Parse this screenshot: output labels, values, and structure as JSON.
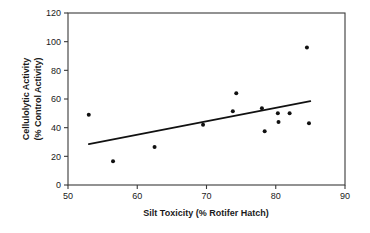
{
  "chart_data": {
    "type": "scatter",
    "title": "",
    "subtitle": "",
    "xlabel": "Silt Toxicity (% Rotifer Hatch)",
    "ylabel_line1": "Cellulolytic Activity",
    "ylabel_line2": "(% Control Activity)",
    "ylabel": "Cellulolytic Activity (% Control Activity)",
    "xlim": [
      50,
      90
    ],
    "ylim": [
      0,
      120
    ],
    "xticks": [
      50,
      60,
      70,
      80,
      90
    ],
    "yticks": [
      0,
      20,
      40,
      60,
      80,
      100,
      120
    ],
    "xtick_labels": [
      "50",
      "60",
      "70",
      "80",
      "90"
    ],
    "ytick_labels": [
      "0",
      "20",
      "40",
      "60",
      "80",
      "100",
      "120"
    ],
    "grid": false,
    "legend": null,
    "legend_position": "none",
    "marker": "filled-circle",
    "marker_color": "#111111",
    "series": [
      {
        "name": "Cellulolytic activity vs silt toxicity",
        "points": [
          {
            "x": 53.0,
            "y": 49.0
          },
          {
            "x": 56.5,
            "y": 16.5
          },
          {
            "x": 62.5,
            "y": 26.5
          },
          {
            "x": 69.5,
            "y": 42.0
          },
          {
            "x": 73.8,
            "y": 51.5
          },
          {
            "x": 74.3,
            "y": 64.0
          },
          {
            "x": 78.0,
            "y": 53.5
          },
          {
            "x": 78.4,
            "y": 37.5
          },
          {
            "x": 80.3,
            "y": 50.0
          },
          {
            "x": 80.4,
            "y": 44.0
          },
          {
            "x": 82.0,
            "y": 50.0
          },
          {
            "x": 84.5,
            "y": 96.0
          },
          {
            "x": 84.8,
            "y": 43.0
          }
        ]
      }
    ],
    "trendline": {
      "name": "linear regression fit",
      "x_start": 53.0,
      "y_start": 28.5,
      "x_end": 85.0,
      "y_end": 58.5,
      "color": "#111111"
    }
  }
}
